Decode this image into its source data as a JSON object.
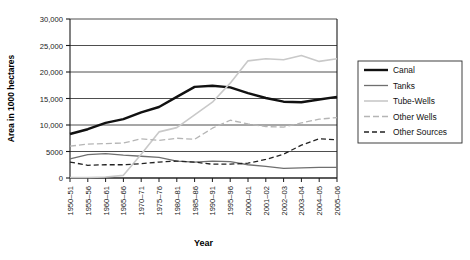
{
  "chart_data": {
    "type": "line",
    "title": "",
    "xlabel": "Year",
    "ylabel": "Area in 1000 hectares",
    "ylim": [
      0,
      30000
    ],
    "yticks": [
      0,
      5000,
      10000,
      15000,
      20000,
      25000,
      30000
    ],
    "ytick_labels": [
      "0",
      "5000",
      "10,000",
      "15,000",
      "20,000",
      "25,000",
      "30,000"
    ],
    "grid": "horizontal",
    "legend_position": "right",
    "categories": [
      "1950–51",
      "1955–56",
      "1960–61",
      "1965–66",
      "1970–71",
      "1975–76",
      "1980–81",
      "1985–86",
      "1990–91",
      "1995–96",
      "2000–01",
      "2001–02",
      "2002–03",
      "2003–04",
      "2004–05",
      "2005–06"
    ],
    "series": [
      {
        "name": "Canal",
        "color": "#111111",
        "width": 2.4,
        "dash": "none",
        "values": [
          8300,
          9200,
          10400,
          11100,
          12400,
          13400,
          15300,
          17200,
          17400,
          17100,
          16000,
          15100,
          14400,
          14300,
          14800,
          15300
        ]
      },
      {
        "name": "Tanks",
        "color": "#6f6f6f",
        "width": 1.3,
        "dash": "none",
        "values": [
          3600,
          4400,
          4600,
          4300,
          4100,
          3900,
          3200,
          3000,
          3200,
          3100,
          2500,
          2200,
          1800,
          1900,
          2000,
          2000
        ]
      },
      {
        "name": "Tube-Wells",
        "color": "#c9c9c9",
        "width": 1.6,
        "dash": "none",
        "values": [
          100,
          100,
          200,
          500,
          4500,
          8700,
          9500,
          11900,
          14300,
          17900,
          22100,
          22500,
          22300,
          23100,
          22000,
          22500
        ]
      },
      {
        "name": "Other Wells",
        "color": "#b5b5b5",
        "width": 1.3,
        "dash": "6 3",
        "values": [
          6000,
          6400,
          6500,
          6600,
          7400,
          7100,
          7500,
          7300,
          9400,
          10900,
          10200,
          9700,
          9600,
          10400,
          11100,
          11400
        ]
      },
      {
        "name": "Other Sources",
        "color": "#222222",
        "width": 1.3,
        "dash": "5 3",
        "values": [
          3000,
          2400,
          2500,
          2500,
          2700,
          3000,
          3200,
          3000,
          2600,
          2600,
          2800,
          3500,
          4500,
          6200,
          7400,
          7200
        ]
      }
    ]
  },
  "legend": {
    "items": [
      {
        "label": "Canal"
      },
      {
        "label": "Tanks"
      },
      {
        "label": "Tube-Wells"
      },
      {
        "label": "Other Wells"
      },
      {
        "label": "Other Sources"
      }
    ]
  }
}
